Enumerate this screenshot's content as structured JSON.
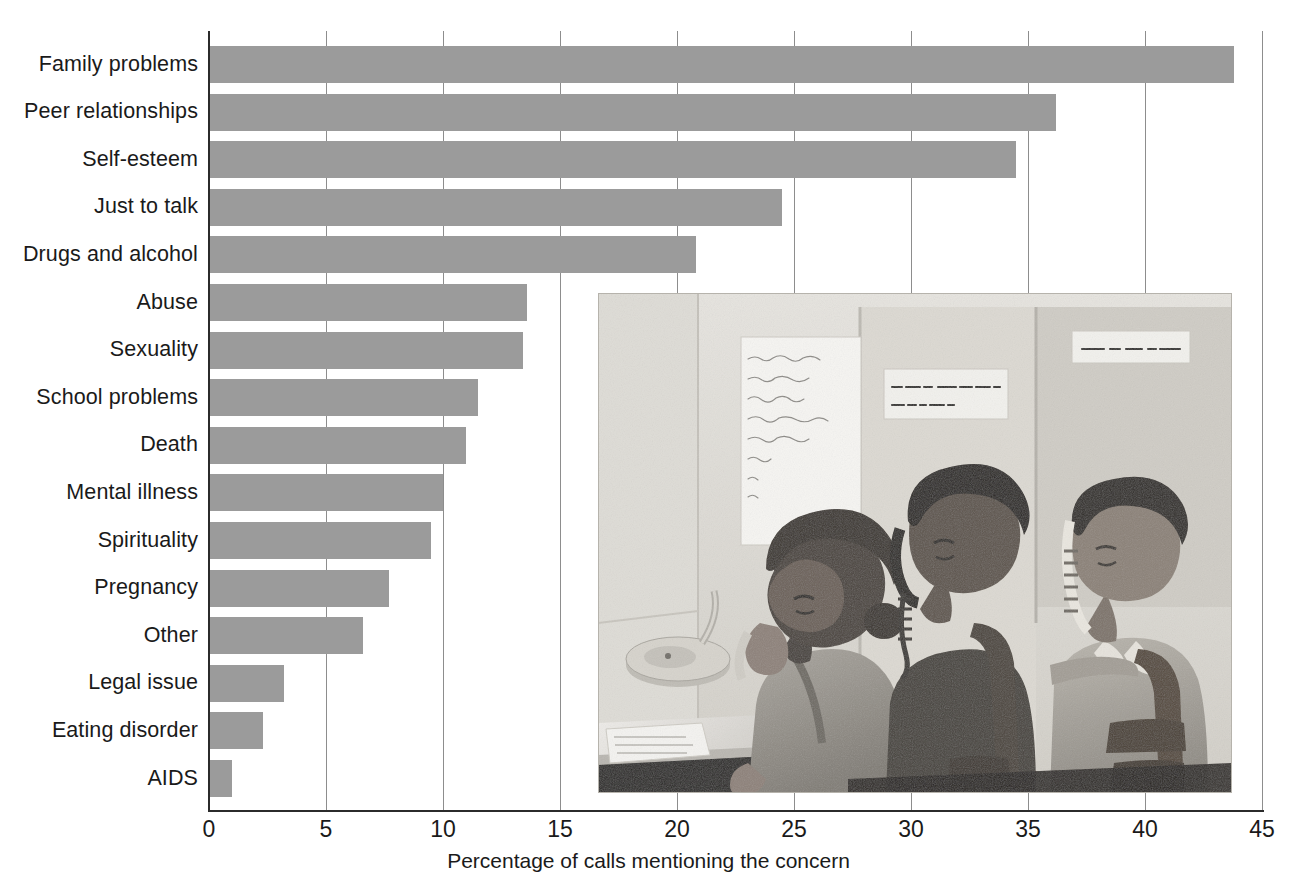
{
  "chart_data": {
    "type": "bar",
    "orientation": "horizontal",
    "title": "",
    "xlabel": "Percentage of calls mentioning the concern",
    "ylabel": "",
    "xlim": [
      0,
      45
    ],
    "xticks": [
      0,
      5,
      10,
      15,
      20,
      25,
      30,
      35,
      40,
      45
    ],
    "grid": "vertical",
    "legend": "none",
    "bar_color": "#9b9b9b",
    "categories": [
      "Family problems",
      "Peer relationships",
      "Self-esteem",
      "Just to talk",
      "Drugs and alcohol",
      "Abuse",
      "Sexuality",
      "School problems",
      "Death",
      "Mental illness",
      "Spirituality",
      "Pregnancy",
      "Other",
      "Legal issue",
      "Eating disorder",
      "AIDS"
    ],
    "values": [
      43.8,
      36.2,
      34.5,
      24.5,
      20.8,
      13.6,
      13.4,
      11.5,
      11.0,
      10.0,
      9.5,
      7.7,
      6.6,
      3.2,
      2.3,
      1.0
    ]
  },
  "photo": {
    "caption_alt": "Three teenage volunteers answering phones at a suicide hot line",
    "wall_signs": [
      "LISTEN WITH CARE!\nSAVE A LIFE!",
      "SUICIDE HOT LINE"
    ],
    "poem_lines": [
      "Razors pain you;",
      "Rivers are damp;",
      "Acids stain you;",
      "And drugs cause cramps",
      "Guns aren't lawful;",
      "Noo...",
      "G...",
      "Yo..."
    ]
  }
}
